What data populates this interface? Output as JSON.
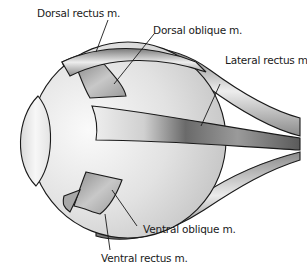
{
  "diagram": {
    "labels": {
      "dorsal_rectus": "Dorsal rectus m.",
      "dorsal_oblique": "Dorsal oblique m.",
      "lateral_rectus": "Lateral rectus m.",
      "ventral_oblique": "Ventral oblique m.",
      "ventral_rectus": "Ventral rectus m."
    },
    "colors": {
      "background": "#ffffff",
      "globe": "#d8d8d8",
      "globe_highlight": "#f4f4f4",
      "muscle_light": "#e6e6e6",
      "muscle_dark": "#6e6e6e",
      "outline": "#1a1a1a"
    }
  }
}
